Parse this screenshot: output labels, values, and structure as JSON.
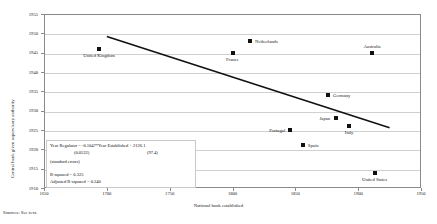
{
  "chart_data": {
    "type": "scatter",
    "title": "",
    "xlabel": "National bank established",
    "ylabel": "Central bank given supervisory authority",
    "xlim": [
      1650,
      1950
    ],
    "ylim": [
      1910,
      1955
    ],
    "xticks": [
      "1650",
      "1700",
      "1750",
      "1800",
      "1850",
      "1900",
      "1950"
    ],
    "yticks": [
      "1910",
      "1915",
      "1920",
      "1925",
      "1930",
      "1935",
      "1940",
      "1945",
      "1950",
      "1955"
    ],
    "grid": true,
    "legend": "none",
    "points": [
      {
        "label": "United Kingdom",
        "x": 1694,
        "y": 1946,
        "label_pos": "below"
      },
      {
        "label": "France",
        "x": 1800,
        "y": 1945,
        "label_pos": "below"
      },
      {
        "label": "Netherlands",
        "x": 1814,
        "y": 1948,
        "label_pos": "right"
      },
      {
        "label": "Australia",
        "x": 1911,
        "y": 1945,
        "label_pos": "above"
      },
      {
        "label": "Germany",
        "x": 1876,
        "y": 1934,
        "label_pos": "right"
      },
      {
        "label": "Japan",
        "x": 1882,
        "y": 1928,
        "label_pos": "left"
      },
      {
        "label": "Italy",
        "x": 1893,
        "y": 1926,
        "label_pos": "below"
      },
      {
        "label": "Portugal",
        "x": 1846,
        "y": 1925,
        "label_pos": "left"
      },
      {
        "label": "Spain",
        "x": 1856,
        "y": 1921,
        "label_pos": "right"
      },
      {
        "label": "United States",
        "x": 1913,
        "y": 1914,
        "label_pos": "below"
      }
    ],
    "trendline": {
      "x0": 1700,
      "y0": 1949.2,
      "x1": 1925,
      "y1": 1925.6
    },
    "annotations": {
      "equation": "Year Regulator = -0.1047*Year Established + 2126.1",
      "se_slope": "(0.0532)",
      "se_intercept": "(97.4)",
      "se_note": "(standard errors)",
      "r_squared": "R-squared = 0.325",
      "adj_r_squared": "Adjusted R-squared =  0.240"
    }
  },
  "footer": {
    "source": "Sources: See text."
  }
}
